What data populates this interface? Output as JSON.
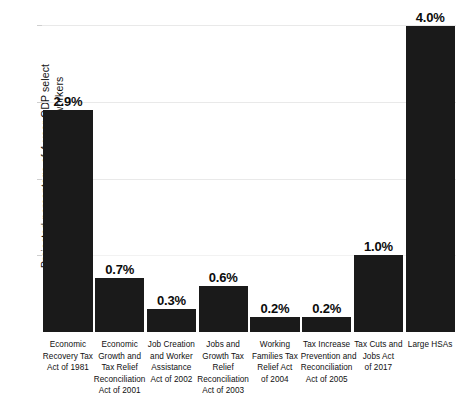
{
  "chart_data": {
    "type": "bar",
    "title": "",
    "subtitle": "",
    "xlabel": "",
    "ylabel": "Projected percentage of 4-year GDP select tax measures would return to workers",
    "ylabel_lines": [
      "Projected percentage of 4-year GDP select",
      "tax measures would return to workers"
    ],
    "ylim": [
      0,
      4.2
    ],
    "grid": true,
    "gridlines": [
      1.0,
      2.0,
      3.0,
      4.0
    ],
    "y_tick_labels": [],
    "legend": null,
    "legend_position": "none",
    "bar_color": "#1a1a1a",
    "gridline_color": "#e9e9e9",
    "categories": [
      "Economic Recovery Tax Act of 1981",
      "Economic Growth and Tax Relief Reconciliation Act of 2001",
      "Job Creation and Worker Assistance Act of 2002",
      "Jobs and Growth Tax Relief Reconciliation Act of 2003",
      "Working Families Tax Relief Act of 2004",
      "Tax Increase Prevention and Reconciliation Act of 2005",
      "Tax Cuts and Jobs Act of 2017",
      "Large HSAs"
    ],
    "category_lines": [
      [
        "Economic",
        "Recovery Tax",
        "Act of 1981"
      ],
      [
        "Economic",
        "Growth and",
        "Tax Relief",
        "Reconciliation",
        "Act of 2001"
      ],
      [
        "Job Creation",
        "and Worker",
        "Assistance",
        "Act of 2002"
      ],
      [
        "Jobs and",
        "Growth Tax",
        "Relief",
        "Reconciliation",
        "Act of 2003"
      ],
      [
        "Working",
        "Families Tax",
        "Relief Act",
        "of 2004"
      ],
      [
        "Tax Increase",
        "Prevention and",
        "Reconciliation",
        "Act of 2005"
      ],
      [
        "Tax Cuts and",
        "Jobs Act",
        "of 2017"
      ],
      [
        "Large HSAs"
      ]
    ],
    "values": [
      2.9,
      0.7,
      0.3,
      0.6,
      0.2,
      0.2,
      1.0,
      4.0
    ],
    "value_labels": [
      "2.9%",
      "0.7%",
      "0.3%",
      "0.6%",
      "0.2%",
      "0.2%",
      "1.0%",
      "4.0%"
    ]
  }
}
